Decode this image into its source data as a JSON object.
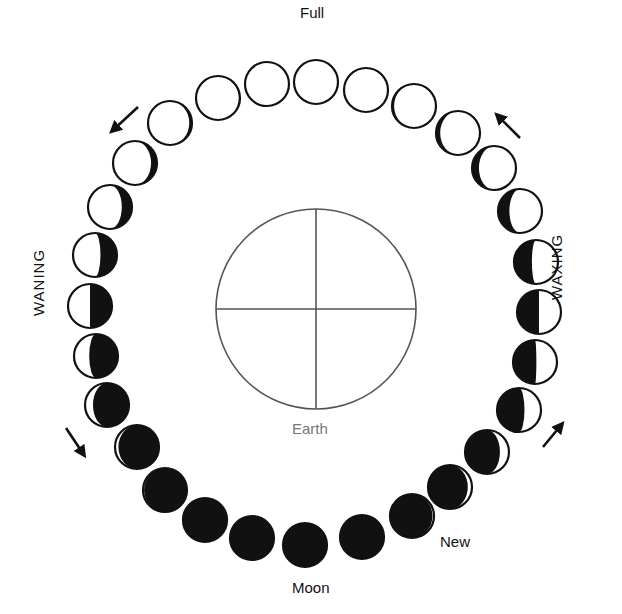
{
  "labels": {
    "full": "Full",
    "new": "New",
    "moon": "Moon",
    "earth": "Earth",
    "waxing": "WAXING",
    "waning": "WANING"
  },
  "colors": {
    "ink": "#111111",
    "earth_outline": "#555555",
    "earth_label": "#777777",
    "background": "#ffffff"
  },
  "earth": {
    "cx": 316,
    "cy": 309,
    "r": 100
  },
  "moon_radius": 22,
  "moons": [
    {
      "x": 316,
      "y": 82,
      "phase": 0.5
    },
    {
      "x": 366,
      "y": 90,
      "phase": 0.47
    },
    {
      "x": 414,
      "y": 106,
      "phase": 0.43
    },
    {
      "x": 458,
      "y": 133,
      "phase": 0.4
    },
    {
      "x": 494,
      "y": 168,
      "phase": 0.37
    },
    {
      "x": 520,
      "y": 211,
      "phase": 0.33
    },
    {
      "x": 536,
      "y": 262,
      "phase": 0.28
    },
    {
      "x": 539,
      "y": 312,
      "phase": 0.25
    },
    {
      "x": 535,
      "y": 362,
      "phase": 0.24
    },
    {
      "x": 519,
      "y": 410,
      "phase": 0.21
    },
    {
      "x": 487,
      "y": 452,
      "phase": 0.15
    },
    {
      "x": 450,
      "y": 487,
      "phase": 0.1
    },
    {
      "x": 412,
      "y": 516,
      "phase": 0.06
    },
    {
      "x": 362,
      "y": 537,
      "phase": 0.03
    },
    {
      "x": 305,
      "y": 545,
      "phase": 0.0
    },
    {
      "x": 252,
      "y": 538,
      "phase": 0.98
    },
    {
      "x": 205,
      "y": 520,
      "phase": 0.97
    },
    {
      "x": 165,
      "y": 490,
      "phase": 0.95
    },
    {
      "x": 137,
      "y": 447,
      "phase": 0.91
    },
    {
      "x": 107,
      "y": 405,
      "phase": 0.86
    },
    {
      "x": 96,
      "y": 356,
      "phase": 0.8
    },
    {
      "x": 90,
      "y": 306,
      "phase": 0.75
    },
    {
      "x": 95,
      "y": 255,
      "phase": 0.71
    },
    {
      "x": 110,
      "y": 207,
      "phase": 0.66
    },
    {
      "x": 135,
      "y": 163,
      "phase": 0.62
    },
    {
      "x": 170,
      "y": 123,
      "phase": 0.58
    },
    {
      "x": 218,
      "y": 98,
      "phase": 0.55
    },
    {
      "x": 267,
      "y": 84,
      "phase": 0.53
    }
  ],
  "arrows": [
    {
      "name": "arrow-waning-top",
      "x1": 138,
      "y1": 107,
      "x2": 112,
      "y2": 131
    },
    {
      "name": "arrow-waxing-top",
      "x1": 520,
      "y1": 138,
      "x2": 497,
      "y2": 115
    },
    {
      "name": "arrow-waning-bottom",
      "x1": 66,
      "y1": 428,
      "x2": 84,
      "y2": 455
    },
    {
      "name": "arrow-waxing-bottom",
      "x1": 543,
      "y1": 447,
      "x2": 562,
      "y2": 424
    }
  ]
}
